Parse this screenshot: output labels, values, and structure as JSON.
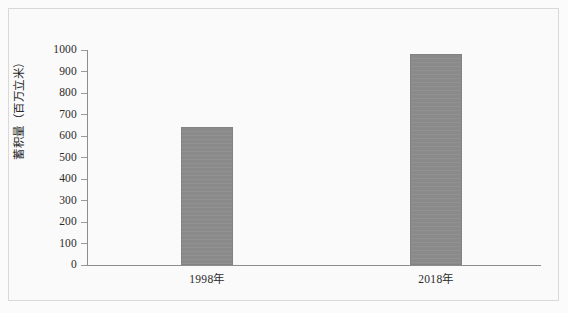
{
  "chart_data": {
    "type": "bar",
    "title": "",
    "xlabel": "",
    "ylabel": "蓄积量（百万立米）",
    "categories": [
      "1998年",
      "2018年"
    ],
    "values": [
      640,
      980
    ],
    "series": [
      {
        "name": "蓄积量",
        "values": [
          640,
          980
        ]
      }
    ],
    "ylim": [
      0,
      1000
    ],
    "y_ticks": [
      0,
      100,
      200,
      300,
      400,
      500,
      600,
      700,
      800,
      900,
      1000
    ],
    "y_tick_labels": [
      "0",
      "100",
      "200",
      "300",
      "400",
      "500",
      "600",
      "700",
      "800",
      "900",
      "1000"
    ],
    "grid": false,
    "legend": "none",
    "bar_color": "#8a8a8a",
    "axis_color": "#8d8d8d",
    "frame_color": "#d9d9d9",
    "background_color": "#fafafa",
    "text_color": "#2b2b2b"
  }
}
